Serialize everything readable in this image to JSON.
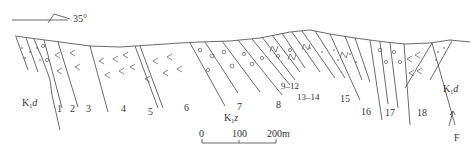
{
  "diagram": {
    "type": "geological-cross-section",
    "strike_indicator": {
      "label": "35°"
    },
    "formations": [
      {
        "id": "K1d-left",
        "label": "K",
        "subscript": "1",
        "suffix": "d"
      },
      {
        "id": "K1z",
        "label": "K",
        "subscript": "1",
        "suffix": "z"
      },
      {
        "id": "K1d-right",
        "label": "K",
        "subscript": "1",
        "suffix": "d"
      }
    ],
    "bed_labels": [
      "1",
      "2",
      "3",
      "4",
      "5",
      "6",
      "7",
      "8",
      "9–12",
      "13–14",
      "15",
      "16",
      "17",
      "18"
    ],
    "fault": {
      "label": "F"
    },
    "scale_bar": {
      "ticks": [
        "0",
        "100",
        "200m"
      ]
    },
    "lithology_symbols": [
      "dots (sandstone)",
      "circles (conglomerate)",
      "V-marks (volcanic)",
      "N-marks"
    ]
  }
}
